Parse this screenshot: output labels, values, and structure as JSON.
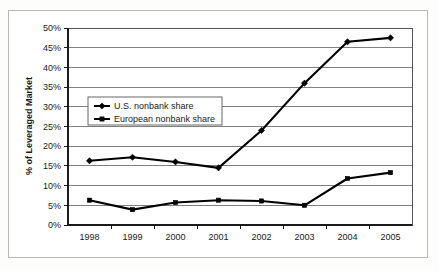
{
  "chart_data": {
    "type": "line",
    "title": "",
    "xlabel": "",
    "ylabel": "% of Leveraged Market",
    "categories": [
      "1998",
      "1999",
      "2000",
      "2001",
      "2002",
      "2003",
      "2004",
      "2005"
    ],
    "ylim": [
      0,
      50
    ],
    "y_tick_labels": [
      "0%",
      "5%",
      "10%",
      "15%",
      "20%",
      "25%",
      "30%",
      "35%",
      "40%",
      "45%",
      "50%"
    ],
    "y_tick_values": [
      0,
      5,
      10,
      15,
      20,
      25,
      30,
      35,
      40,
      45,
      50
    ],
    "y_unit": "%",
    "grid": true,
    "grid_axis": "y",
    "legend_position": "upper-left-inside",
    "series": [
      {
        "name": "U.S. nonbank share",
        "marker": "diamond",
        "color": "#000000",
        "values": [
          16.3,
          17.2,
          16.0,
          14.5,
          24.0,
          36.0,
          46.5,
          47.5
        ]
      },
      {
        "name": "European nonbank share",
        "marker": "square",
        "color": "#000000",
        "values": [
          6.3,
          3.9,
          5.7,
          6.3,
          6.1,
          5.0,
          11.8,
          13.3
        ]
      }
    ]
  },
  "figure": {
    "background_color": "#fdfdfb",
    "plot_background_color": "#ffffff",
    "frame_color": "#b9b9b4",
    "gridline_color": "#808080",
    "axis_color": "#1a1a1a"
  },
  "legend": {
    "entries": [
      {
        "label": "U.S. nonbank share",
        "marker": "diamond"
      },
      {
        "label": "European nonbank share",
        "marker": "square"
      }
    ]
  }
}
